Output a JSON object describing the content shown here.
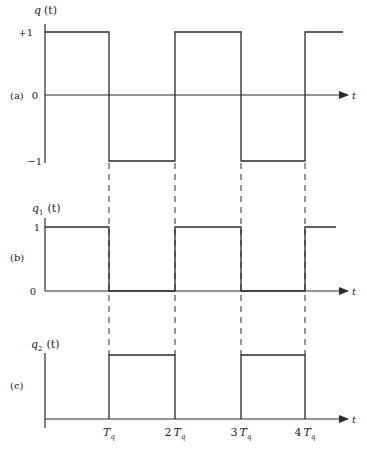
{
  "figure": {
    "panels": [
      {
        "id": "a",
        "tag": "(a)",
        "ylabel_var": "q",
        "ylabel_sub": "",
        "ylabel_arg": "(t)",
        "ytick_top": "+1",
        "ytick_mid": "0",
        "ytick_bottom": "−1",
        "xlabel": "t",
        "description": "Bipolar square wave: +1 on [0,Tq), −1 on [Tq,2Tq), +1 on [2Tq,3Tq), −1 on [3Tq,4Tq), +1 after 4Tq"
      },
      {
        "id": "b",
        "tag": "(b)",
        "ylabel_var": "q",
        "ylabel_sub": "1",
        "ylabel_arg": "(t)",
        "ytick_top": "1",
        "ytick_zero": "0",
        "xlabel": "t",
        "description": "Unipolar pulse train: 1 on [0,Tq), 0 on [Tq,2Tq), 1 on [2Tq,3Tq), 0 on [3Tq,4Tq), 1 after 4Tq"
      },
      {
        "id": "c",
        "tag": "(c)",
        "ylabel_var": "q",
        "ylabel_sub": "2",
        "ylabel_arg": "(t)",
        "xlabel": "t",
        "description": "Complementary pulse train: 0 on [0,Tq), 1 on [Tq,2Tq), 0 on [2Tq,3Tq), 1 on [3Tq,4Tq)"
      }
    ],
    "xticks": [
      {
        "coef": "",
        "sym": "T",
        "sub": "q"
      },
      {
        "coef": "2",
        "sym": "T",
        "sub": "q"
      },
      {
        "coef": "3",
        "sym": "T",
        "sub": "q"
      },
      {
        "coef": "4",
        "sym": "T",
        "sub": "q"
      }
    ],
    "colors": {
      "line": "#2a2a2a",
      "background": "#ffffff"
    }
  }
}
